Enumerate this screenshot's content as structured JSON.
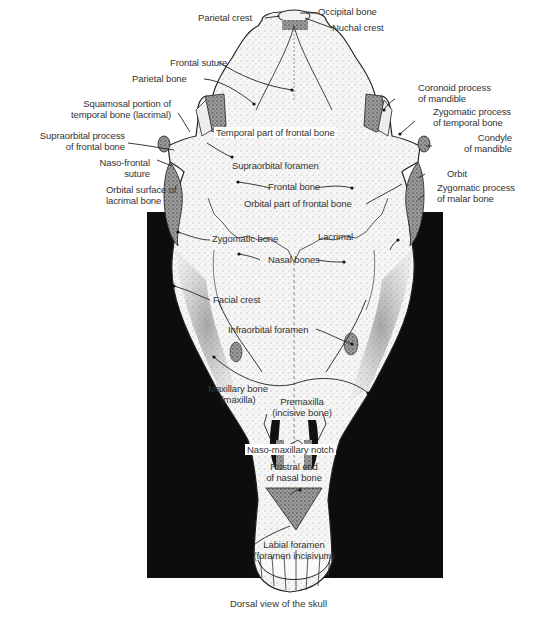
{
  "figure": {
    "caption": "Dorsal view of the skull",
    "colors": {
      "background_panel": "#0d0d0d",
      "bone": "#f4f4f4",
      "shade": "#7a7a7a",
      "ink": "#222222",
      "text": "#333333"
    }
  },
  "labels": {
    "occipital_bone": "Occipital bone",
    "nuchal_crest": "Nuchal crest",
    "parietal_crest": "Parietal crest",
    "frontal_suture": "Frontal suture",
    "parietal_bone": "Parietal bone",
    "squamosal_1": "Squamosal portion of",
    "squamosal_2": "temporal bone (lacrimal)",
    "supraorbital_process_1": "Supraorbital process",
    "supraorbital_process_2": "of frontal bone",
    "naso_frontal_1": "Naso-frontal",
    "naso_frontal_2": "suture",
    "orbital_surface_1": "Orbital surface of",
    "orbital_surface_2": "lacrimal bone",
    "coronoid_1": "Coronoid process",
    "coronoid_2": "of mandible",
    "zyg_temporal_1": "Zygomatic process",
    "zyg_temporal_2": "of temporal bone",
    "condyle_1": "Condyle",
    "condyle_2": "of mandible",
    "orbit": "Orbit",
    "zyg_malar_1": "Zygomatic process",
    "zyg_malar_2": "of malar bone",
    "temporal_part": "Temporal part of frontal bone",
    "supraorbital_foramen": "Supraorbital foramen",
    "frontal_bone": "Frontal bone",
    "orbital_part": "Orbital part of frontal bone",
    "zygomatic_bone": "Zygomatic bone",
    "lacrimal": "Lacrimal",
    "nasal_bones": "Nasal bones",
    "facial_crest": "Facial crest",
    "infraorbital_foramen": "Infraorbital foramen",
    "maxillary_1": "Maxillary bone",
    "maxillary_2": "(maxilla)",
    "premaxilla_1": "Premaxilla",
    "premaxilla_2": "(incisive bone)",
    "naso_maxillary_notch": "Naso-maxillary notch",
    "rostral_1": "Rostral end",
    "rostral_2": "of nasal bone",
    "labial_1": "Labial foramen",
    "labial_2": "(foramen incisivum)"
  }
}
